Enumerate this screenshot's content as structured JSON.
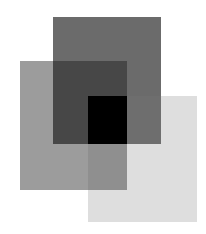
{
  "diagram": {
    "title": "",
    "background": "#ffffff",
    "rects": [
      {
        "name": "dark-square",
        "x": 53,
        "y": 17,
        "w": 108,
        "h": 127,
        "color": "#6b6b6b"
      },
      {
        "name": "medium-square",
        "x": 20,
        "y": 61,
        "w": 107,
        "h": 129,
        "color": "#9c9c9c"
      },
      {
        "name": "light-square",
        "x": 88,
        "y": 96,
        "w": 109,
        "h": 126,
        "color": "#dedede"
      }
    ],
    "overlaps": [
      {
        "name": "dark-medium-overlap",
        "x": 53,
        "y": 61,
        "w": 74,
        "h": 83,
        "color": "#474747"
      },
      {
        "name": "dark-light-overlap",
        "x": 127,
        "y": 96,
        "w": 34,
        "h": 48,
        "color": "#6e6e6e"
      },
      {
        "name": "medium-light-overlap",
        "x": 88,
        "y": 144,
        "w": 39,
        "h": 46,
        "color": "#8f8f8f"
      },
      {
        "name": "triple-overlap",
        "x": 88,
        "y": 96,
        "w": 39,
        "h": 48,
        "color": "#000000"
      }
    ]
  }
}
